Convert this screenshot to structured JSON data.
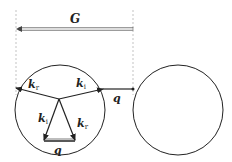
{
  "diagram": {
    "type": "reciprocal-lattice scattering construction",
    "labels": {
      "G": "G",
      "q_top": "q",
      "q_bottom": "q",
      "k_upper_left": {
        "base": "k",
        "sub": "r"
      },
      "k_upper_right": {
        "base": "k",
        "sub": "i"
      },
      "k_lower_left": {
        "base": "k",
        "sub": "i"
      },
      "k_lower_right": {
        "base": "k",
        "sub": "r"
      }
    },
    "colors": {
      "stroke": "#222222",
      "dashed": "#aaaaaa",
      "g_arrow_fill": "#bbbbbb"
    }
  }
}
